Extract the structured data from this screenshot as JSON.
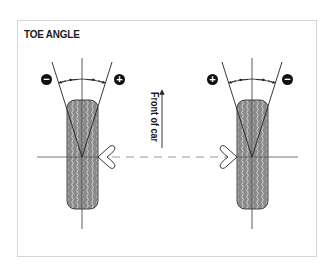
{
  "diagram": {
    "title": "TOE ANGLE",
    "direction_label": "Front of car",
    "left_wheel": {
      "minus_sign": "−",
      "plus_sign": "+",
      "minus_side": "outer (left)",
      "plus_side": "inner (right)"
    },
    "right_wheel": {
      "plus_sign": "+",
      "minus_sign": "−",
      "plus_side": "inner (left)",
      "minus_side": "outer (right)"
    },
    "colors": {
      "tire_fill": "#8a8a8a",
      "tread_lines": "#d8d8d8",
      "outline": "#222222",
      "axis_lines": "#555555",
      "dashed_line": "#9a9a9a",
      "frame_border": "#d6d6d6",
      "sign_badge": "#111111"
    },
    "icons": {
      "direction_arrow": "arrow-up-icon",
      "minus": "minus-circle-icon",
      "plus": "plus-circle-icon"
    }
  }
}
